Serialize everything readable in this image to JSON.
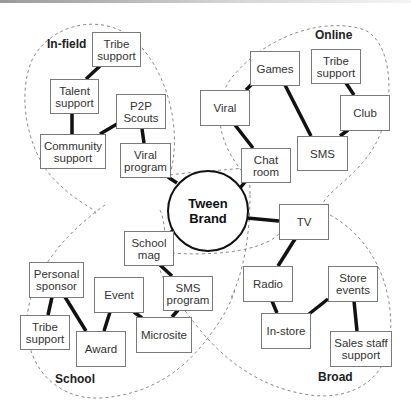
{
  "hub": {
    "label": "Tween\nBrand"
  },
  "groups": {
    "in_field": {
      "label": "In-field"
    },
    "online": {
      "label": "Online"
    },
    "school": {
      "label": "School"
    },
    "broad": {
      "label": "Broad"
    }
  },
  "nodes": {
    "infield_tribe_support": "Tribe\nsupport",
    "talent_support": "Talent\nsupport",
    "p2p_scouts": "P2P\nScouts",
    "community_support": "Community\nsupport",
    "viral_program": "Viral\nprogram",
    "games": "Games",
    "online_tribe_support": "Tribe\nsupport",
    "viral": "Viral",
    "club": "Club",
    "sms": "SMS",
    "chat_room": "Chat\nroom",
    "school_mag": "School\nmag",
    "personal_sponsor": "Personal\nsponsor",
    "event": "Event",
    "sms_program": "SMS\nprogram",
    "school_tribe_support": "Tribe\nsupport",
    "award": "Award",
    "microsite": "Microsite",
    "tv": "TV",
    "radio": "Radio",
    "store_events": "Store\nevents",
    "in_store": "In-store",
    "sales_staff_support": "Sales staff\nsupport"
  },
  "edges": [
    [
      "infield_tribe_support",
      "talent_support"
    ],
    [
      "talent_support",
      "community_support"
    ],
    [
      "community_support",
      "p2p_scouts"
    ],
    [
      "p2p_scouts",
      "viral_program"
    ],
    [
      "viral_program",
      "hub"
    ],
    [
      "viral",
      "games"
    ],
    [
      "viral",
      "chat_room"
    ],
    [
      "games",
      "sms"
    ],
    [
      "online_tribe_support",
      "club"
    ],
    [
      "club",
      "sms"
    ],
    [
      "chat_room",
      "hub"
    ],
    [
      "hub",
      "tv"
    ],
    [
      "tv",
      "radio"
    ],
    [
      "radio",
      "in_store"
    ],
    [
      "in_store",
      "store_events"
    ],
    [
      "store_events",
      "sales_staff_support"
    ],
    [
      "hub",
      "school_mag"
    ],
    [
      "school_mag",
      "sms_program"
    ],
    [
      "sms_program",
      "microsite"
    ],
    [
      "microsite",
      "event"
    ],
    [
      "event",
      "award"
    ],
    [
      "award",
      "personal_sponsor"
    ],
    [
      "personal_sponsor",
      "school_tribe_support"
    ]
  ],
  "colors": {
    "edge": "#111111",
    "border": "#7a7a7a",
    "dashed": "#8a8a8a"
  }
}
